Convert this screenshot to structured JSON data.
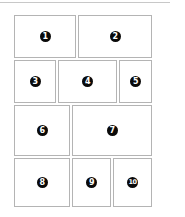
{
  "layout": {
    "title": "",
    "panels": [
      {
        "id": 1,
        "label": "1",
        "x": 14,
        "y": 15,
        "w": 62,
        "h": 43
      },
      {
        "id": 2,
        "label": "2",
        "x": 78,
        "y": 15,
        "w": 74,
        "h": 43
      },
      {
        "id": 3,
        "label": "3",
        "x": 14,
        "y": 60,
        "w": 42,
        "h": 43
      },
      {
        "id": 4,
        "label": "4",
        "x": 58,
        "y": 60,
        "w": 59,
        "h": 43
      },
      {
        "id": 5,
        "label": "5",
        "x": 119,
        "y": 60,
        "w": 33,
        "h": 43
      },
      {
        "id": 6,
        "label": "6",
        "x": 14,
        "y": 105,
        "w": 56,
        "h": 51
      },
      {
        "id": 7,
        "label": "7",
        "x": 72,
        "y": 105,
        "w": 80,
        "h": 51
      },
      {
        "id": 8,
        "label": "8",
        "x": 14,
        "y": 158,
        "w": 56,
        "h": 49
      },
      {
        "id": 9,
        "label": "9",
        "x": 72,
        "y": 158,
        "w": 39,
        "h": 49
      },
      {
        "id": 10,
        "label": "10",
        "x": 113,
        "y": 158,
        "w": 39,
        "h": 49
      }
    ]
  },
  "colors": {
    "border": "#b4b4b4",
    "badge_bg": "#0a0a0a",
    "badge_text": "#ffffff",
    "background": "#ffffff"
  }
}
